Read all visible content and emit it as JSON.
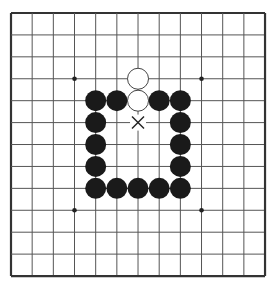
{
  "board": {
    "size": 13,
    "origin_x": 11,
    "origin_y": 13,
    "spacing_x": 21.17,
    "spacing_y": 21.92,
    "line_color": "#555555",
    "border_color": "#333333",
    "background": "#ffffff",
    "stone_radius": 10.5
  },
  "star_points": [
    {
      "col": 3,
      "row": 3
    },
    {
      "col": 9,
      "row": 3
    },
    {
      "col": 3,
      "row": 9
    },
    {
      "col": 9,
      "row": 9
    }
  ],
  "stones": [
    {
      "color": "white",
      "col": 6,
      "row": 3
    },
    {
      "color": "white",
      "col": 6,
      "row": 4
    },
    {
      "color": "black",
      "col": 4,
      "row": 4
    },
    {
      "color": "black",
      "col": 5,
      "row": 4
    },
    {
      "color": "black",
      "col": 7,
      "row": 4
    },
    {
      "color": "black",
      "col": 8,
      "row": 4
    },
    {
      "color": "black",
      "col": 4,
      "row": 5
    },
    {
      "color": "black",
      "col": 4,
      "row": 6
    },
    {
      "color": "black",
      "col": 4,
      "row": 7
    },
    {
      "color": "black",
      "col": 8,
      "row": 5
    },
    {
      "color": "black",
      "col": 8,
      "row": 6
    },
    {
      "color": "black",
      "col": 8,
      "row": 7
    },
    {
      "color": "black",
      "col": 4,
      "row": 8
    },
    {
      "color": "black",
      "col": 5,
      "row": 8
    },
    {
      "color": "black",
      "col": 6,
      "row": 8
    },
    {
      "color": "black",
      "col": 7,
      "row": 8
    },
    {
      "color": "black",
      "col": 8,
      "row": 8
    }
  ],
  "marks": [
    {
      "type": "x-mark",
      "col": 6,
      "row": 5
    }
  ],
  "colors": {
    "black_stone": "#1a1a1a",
    "white_stone_fill": "#ffffff",
    "white_stone_stroke": "#444444",
    "mark": "#222222"
  }
}
